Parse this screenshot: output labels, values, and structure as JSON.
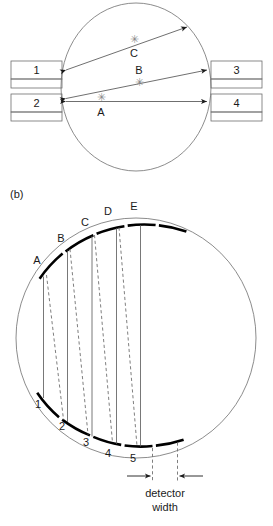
{
  "figure": {
    "panel_a": {
      "label": "",
      "object_shape": "circle",
      "detectors": [
        {
          "id": "1",
          "label": "1",
          "side": "left",
          "position": "upper"
        },
        {
          "id": "2",
          "label": "2",
          "side": "left",
          "position": "lower"
        },
        {
          "id": "3",
          "label": "3",
          "side": "right",
          "position": "upper"
        },
        {
          "id": "4",
          "label": "4",
          "side": "right",
          "position": "lower"
        }
      ],
      "points": [
        {
          "label": "A",
          "marker": "asterisk",
          "marker_glyph": "✳"
        },
        {
          "label": "B",
          "marker": "asterisk",
          "marker_glyph": "✳"
        },
        {
          "label": "C",
          "marker": "asterisk",
          "marker_glyph": "✳"
        }
      ],
      "rays": [
        {
          "name": "ray-A",
          "from": "2",
          "to": "4",
          "through": "A",
          "arrowheads": "both"
        },
        {
          "name": "ray-B",
          "from": "2",
          "to": "3",
          "through": "B",
          "arrowheads": "both"
        },
        {
          "name": "ray-C",
          "from": "1",
          "to": "circle-edge",
          "through": "C",
          "arrowheads": "both"
        }
      ]
    },
    "panel_b": {
      "label": "(b)",
      "object_shape": "circle",
      "top_arcs": [
        {
          "label": "A"
        },
        {
          "label": "B"
        },
        {
          "label": "C"
        },
        {
          "label": "D"
        },
        {
          "label": "E"
        }
      ],
      "bottom_arcs": [
        {
          "label": "1"
        },
        {
          "label": "2"
        },
        {
          "label": "3"
        },
        {
          "label": "4"
        },
        {
          "label": "5"
        }
      ],
      "ray_count": 5,
      "ray_styles": [
        "solid",
        "dashed"
      ],
      "dimension": {
        "label_line1": "detector",
        "label_line2": "width",
        "arrow_style": "inward-double"
      }
    },
    "caption": ""
  },
  "colors": {
    "outline": "#6e6e6e",
    "thick_arc": "#000000",
    "ray": "#4a4a4a",
    "dashed_ray": "#707070",
    "marker": "#8a8a8a",
    "text": "#1a1a1a",
    "background": "#ffffff"
  }
}
